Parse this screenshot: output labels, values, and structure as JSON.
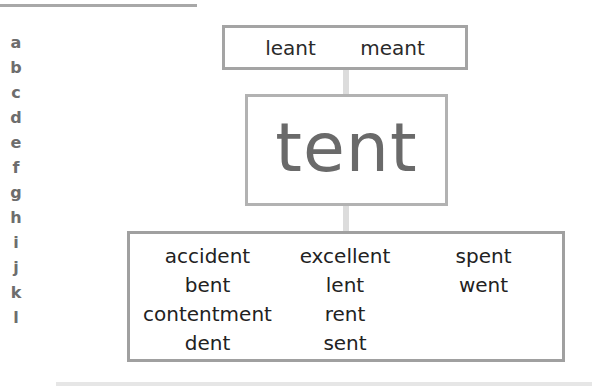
{
  "side_letters": [
    "a",
    "b",
    "c",
    "d",
    "e",
    "f",
    "g",
    "h",
    "i",
    "j",
    "k",
    "l"
  ],
  "diagram": {
    "top_words": [
      "leant",
      "meant"
    ],
    "center_word": "tent",
    "bottom_columns": [
      [
        "accident",
        "bent",
        "contentment",
        "dent"
      ],
      [
        "excellent",
        "lent",
        "rent",
        "sent"
      ],
      [
        "spent",
        "went"
      ]
    ]
  }
}
